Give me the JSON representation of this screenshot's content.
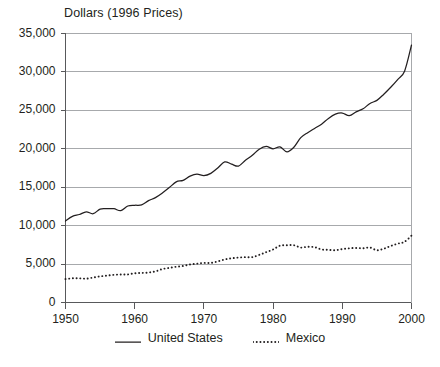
{
  "chart_data": {
    "type": "line",
    "title": "Dollars (1996 Prices)",
    "xlabel": "",
    "ylabel": "",
    "xlim": [
      1950,
      2000
    ],
    "ylim": [
      0,
      35000
    ],
    "grid": true,
    "legend_position": "bottom-center",
    "y_ticks": [
      0,
      5000,
      10000,
      15000,
      20000,
      25000,
      30000,
      35000
    ],
    "y_tick_labels": [
      "0",
      "5,000",
      "10,000",
      "15,000",
      "20,000",
      "25,000",
      "30,000",
      "35,000"
    ],
    "x_ticks": [
      1950,
      1960,
      1970,
      1980,
      1990,
      2000
    ],
    "x_tick_labels": [
      "1950",
      "1960",
      "1970",
      "1980",
      "1990",
      "2000"
    ],
    "x": [
      1950,
      1951,
      1952,
      1953,
      1954,
      1955,
      1956,
      1957,
      1958,
      1959,
      1960,
      1961,
      1962,
      1963,
      1964,
      1965,
      1966,
      1967,
      1968,
      1969,
      1970,
      1971,
      1972,
      1973,
      1974,
      1975,
      1976,
      1977,
      1978,
      1979,
      1980,
      1981,
      1982,
      1983,
      1984,
      1985,
      1986,
      1987,
      1988,
      1989,
      1990,
      1991,
      1992,
      1993,
      1994,
      1995,
      1996,
      1997,
      1998,
      1999,
      2000
    ],
    "series": [
      {
        "name": "United States",
        "style": "solid",
        "color": "#231f20",
        "values": [
          10600,
          11200,
          11450,
          11800,
          11550,
          12150,
          12200,
          12200,
          11950,
          12550,
          12650,
          12700,
          13250,
          13650,
          14250,
          14950,
          15700,
          15900,
          16450,
          16700,
          16500,
          16800,
          17500,
          18300,
          18000,
          17750,
          18500,
          19150,
          19950,
          20300,
          20000,
          20250,
          19600,
          20200,
          21450,
          22100,
          22650,
          23200,
          23950,
          24500,
          24650,
          24300,
          24800,
          25200,
          25900,
          26300,
          27100,
          28000,
          29000,
          30100,
          33500
        ]
      },
      {
        "name": "Mexico",
        "style": "dotted",
        "color": "#231f20",
        "values": [
          3050,
          3150,
          3150,
          3100,
          3250,
          3400,
          3500,
          3600,
          3650,
          3650,
          3800,
          3850,
          3900,
          4050,
          4350,
          4500,
          4650,
          4750,
          4950,
          5050,
          5150,
          5150,
          5350,
          5600,
          5750,
          5850,
          5900,
          5900,
          6200,
          6550,
          6900,
          7400,
          7450,
          7450,
          7150,
          7250,
          7200,
          6900,
          6850,
          6800,
          6950,
          7050,
          7100,
          7050,
          7150,
          6800,
          7000,
          7350,
          7650,
          7900,
          8700
        ]
      }
    ]
  },
  "legend": {
    "items": [
      {
        "label": "United States",
        "style": "solid"
      },
      {
        "label": "Mexico",
        "style": "dotted"
      }
    ]
  },
  "axis": {
    "line_color": "#58595b",
    "grid_color": "#a7a9ac"
  }
}
